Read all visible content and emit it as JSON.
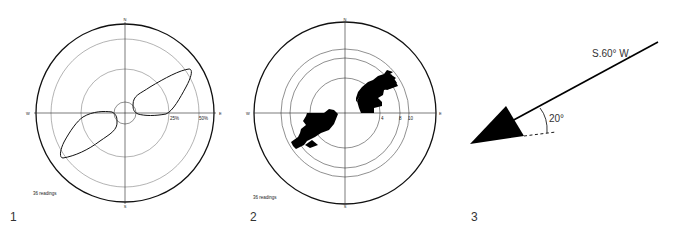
{
  "figures": [
    {
      "number": "1",
      "type": "rose-diagram-curve",
      "directions": {
        "n": "N",
        "s": "S",
        "e": "E",
        "w": "W"
      },
      "ring_labels": [
        "25%",
        "50%"
      ],
      "readings_label": "36 readings"
    },
    {
      "number": "2",
      "type": "rose-diagram-histogram",
      "directions": {
        "n": "N",
        "s": "S",
        "e": "E",
        "w": "W"
      },
      "ring_labels": [
        "4",
        "8",
        "10"
      ],
      "readings_label": "36 readings"
    },
    {
      "number": "3",
      "type": "direction-arrow",
      "bearing_label": "S.60° W.",
      "plunge_label": "20°"
    }
  ],
  "colors": {
    "ink": "#111111",
    "grid": "#555555",
    "background": "#ffffff"
  }
}
